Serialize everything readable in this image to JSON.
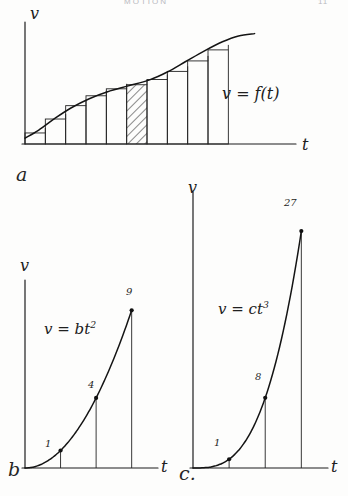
{
  "page": {
    "header_title": "MOTION",
    "header_page": "11",
    "width": 348,
    "height": 496,
    "ink_color": "#1d1d1d",
    "paper_color": "#fdfdfc"
  },
  "figures": {
    "a": {
      "panel_label": "a",
      "equation": "v = f(t)",
      "y_axis_label": "v",
      "x_axis_label": "t"
    },
    "b": {
      "panel_label": "b",
      "equation_prefix": "v = bt",
      "equation_exponent": "2",
      "y_axis_label": "v",
      "x_axis_label": "t",
      "point_labels": [
        "1",
        "4",
        "9"
      ]
    },
    "c": {
      "panel_label": "c.",
      "equation_prefix": "v = ct",
      "equation_exponent": "3",
      "y_axis_label": "v",
      "x_axis_label": "t",
      "point_labels": [
        "1",
        "8",
        "27"
      ]
    }
  },
  "chart_data": [
    {
      "type": "area",
      "id": "fig-a",
      "title": "v = f(t)",
      "xlabel": "t",
      "ylabel": "v",
      "grid": false,
      "legend": null,
      "description": "Velocity-time curve with inscribed Riemann-sum rectangles; the fifth rectangle is hatched.",
      "curve_points": [
        [
          0.0,
          0.05
        ],
        [
          0.06,
          0.12
        ],
        [
          0.13,
          0.22
        ],
        [
          0.2,
          0.31
        ],
        [
          0.28,
          0.39
        ],
        [
          0.36,
          0.45
        ],
        [
          0.45,
          0.5
        ],
        [
          0.54,
          0.55
        ],
        [
          0.62,
          0.62
        ],
        [
          0.7,
          0.71
        ],
        [
          0.78,
          0.8
        ],
        [
          0.86,
          0.88
        ],
        [
          0.93,
          0.93
        ],
        [
          1.0,
          0.95
        ]
      ],
      "rectangles": [
        {
          "x0": 0.0,
          "x1": 0.093,
          "height": 0.095,
          "hatched": false
        },
        {
          "x0": 0.093,
          "x1": 0.186,
          "height": 0.215,
          "hatched": false
        },
        {
          "x0": 0.186,
          "x1": 0.279,
          "height": 0.33,
          "hatched": false
        },
        {
          "x0": 0.279,
          "x1": 0.372,
          "height": 0.415,
          "hatched": false
        },
        {
          "x0": 0.372,
          "x1": 0.465,
          "height": 0.475,
          "hatched": false
        },
        {
          "x0": 0.465,
          "x1": 0.558,
          "height": 0.51,
          "hatched": true
        },
        {
          "x0": 0.558,
          "x1": 0.651,
          "height": 0.555,
          "hatched": false
        },
        {
          "x0": 0.651,
          "x1": 0.744,
          "height": 0.625,
          "hatched": false
        },
        {
          "x0": 0.744,
          "x1": 0.837,
          "height": 0.715,
          "hatched": false
        },
        {
          "x0": 0.837,
          "x1": 0.93,
          "height": 0.81,
          "hatched": false
        }
      ],
      "xlim": [
        0,
        1.18
      ],
      "ylim": [
        0,
        1.05
      ]
    },
    {
      "type": "line",
      "id": "fig-b",
      "title": "v = bt^2",
      "xlabel": "t",
      "ylabel": "v",
      "grid": false,
      "legend": null,
      "description": "Quadratic velocity curve v = bt^2 with ordinates drawn at t = 1, 2, 3.",
      "x": [
        0,
        1,
        2,
        3
      ],
      "y": [
        0,
        1,
        4,
        9
      ],
      "marked_points": [
        {
          "x": 1,
          "y": 1,
          "label": "1"
        },
        {
          "x": 2,
          "y": 4,
          "label": "4"
        },
        {
          "x": 3,
          "y": 9,
          "label": "9"
        }
      ],
      "xlim": [
        0,
        3.6
      ],
      "ylim": [
        0,
        10.5
      ]
    },
    {
      "type": "line",
      "id": "fig-c",
      "title": "v = ct^3",
      "xlabel": "t",
      "ylabel": "v",
      "grid": false,
      "legend": null,
      "description": "Cubic velocity curve v = ct^3 with ordinates drawn at t = 1, 2, 3.",
      "x": [
        0,
        1,
        2,
        3
      ],
      "y": [
        0,
        1,
        8,
        27
      ],
      "marked_points": [
        {
          "x": 1,
          "y": 1,
          "label": "1"
        },
        {
          "x": 2,
          "y": 8,
          "label": "8"
        },
        {
          "x": 3,
          "y": 27,
          "label": "27"
        }
      ],
      "xlim": [
        0,
        3.6
      ],
      "ylim": [
        0,
        31
      ]
    }
  ]
}
